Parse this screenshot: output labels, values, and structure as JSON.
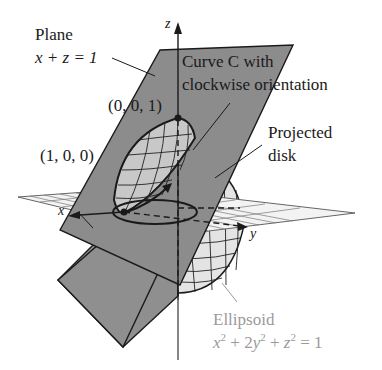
{
  "figure": {
    "labels": {
      "plane_line1": "Plane",
      "plane_line2": "x + z = 1",
      "curve_line1": "Curve C with",
      "curve_line2": "clockwise orientation",
      "point_001": "(0, 0, 1)",
      "point_100": "(1, 0, 0)",
      "projected_line1": "Projected",
      "projected_line2": "disk",
      "ellipsoid_line1": "Ellipsoid",
      "ellipsoid_eq_x": "x",
      "ellipsoid_eq_mid1": " + 2",
      "ellipsoid_eq_y": "y",
      "ellipsoid_eq_mid2": " + ",
      "ellipsoid_eq_z": "z",
      "ellipsoid_eq_end": " = 1",
      "sup2": "2"
    },
    "axes": {
      "x": "x",
      "y": "y",
      "z": "z"
    },
    "colors": {
      "plane_fill": "#8c8c8c",
      "ellipsoid_fill": "#e8e8e8",
      "grid_fill": "#f2f2f2",
      "line": "#1a1a1a",
      "ellipsoid_label": "#9a9a9a"
    }
  }
}
